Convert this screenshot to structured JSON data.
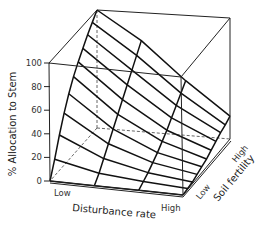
{
  "chart_data": {
    "type": "surface3d",
    "title": "",
    "zlabel": "% Allocation to Stem",
    "xlabel": "Disturbance rate",
    "ylabel": "Soil fertility",
    "zlim": [
      0,
      100
    ],
    "z_ticks": [
      "0",
      "20",
      "40",
      "60",
      "80",
      "100"
    ],
    "x_ticks": [
      "Low",
      "High"
    ],
    "y_ticks": [
      "Low",
      "High"
    ],
    "grid": false,
    "x": [
      "Low",
      "Medium-Low",
      "Medium-High",
      "High"
    ],
    "y_levels": 11,
    "series": [
      {
        "name": "Soil fertility: Low",
        "values": [
          0,
          0,
          0,
          0
        ]
      },
      {
        "name": "Soil fertility: level 2",
        "values": [
          14,
          6,
          3,
          1
        ]
      },
      {
        "name": "Soil fertility: level 3",
        "values": [
          30,
          14,
          6,
          2
        ]
      },
      {
        "name": "Soil fertility: level 4",
        "values": [
          44,
          22,
          10,
          4
        ]
      },
      {
        "name": "Soil fertility: level 5",
        "values": [
          56,
          30,
          14,
          6
        ]
      },
      {
        "name": "Soil fertility: level 6",
        "values": [
          66,
          38,
          19,
          8
        ]
      },
      {
        "name": "Soil fertility: level 7",
        "values": [
          74,
          46,
          24,
          11
        ]
      },
      {
        "name": "Soil fertility: level 8",
        "values": [
          81,
          54,
          30,
          14
        ]
      },
      {
        "name": "Soil fertility: level 9",
        "values": [
          88,
          62,
          36,
          17
        ]
      },
      {
        "name": "Soil fertility: level 10",
        "values": [
          94,
          70,
          42,
          19
        ]
      },
      {
        "name": "Soil fertility: High",
        "values": [
          100,
          78,
          48,
          22
        ]
      }
    ]
  },
  "labels": {
    "zaxis": "% Allocation to Stem",
    "xaxis": "Disturbance rate",
    "yaxis": "Soil fertility",
    "x_low": "Low",
    "x_high": "High",
    "y_low": "Low",
    "y_high": "High",
    "z_ticks": [
      "0",
      "20",
      "40",
      "60",
      "80",
      "100"
    ]
  }
}
